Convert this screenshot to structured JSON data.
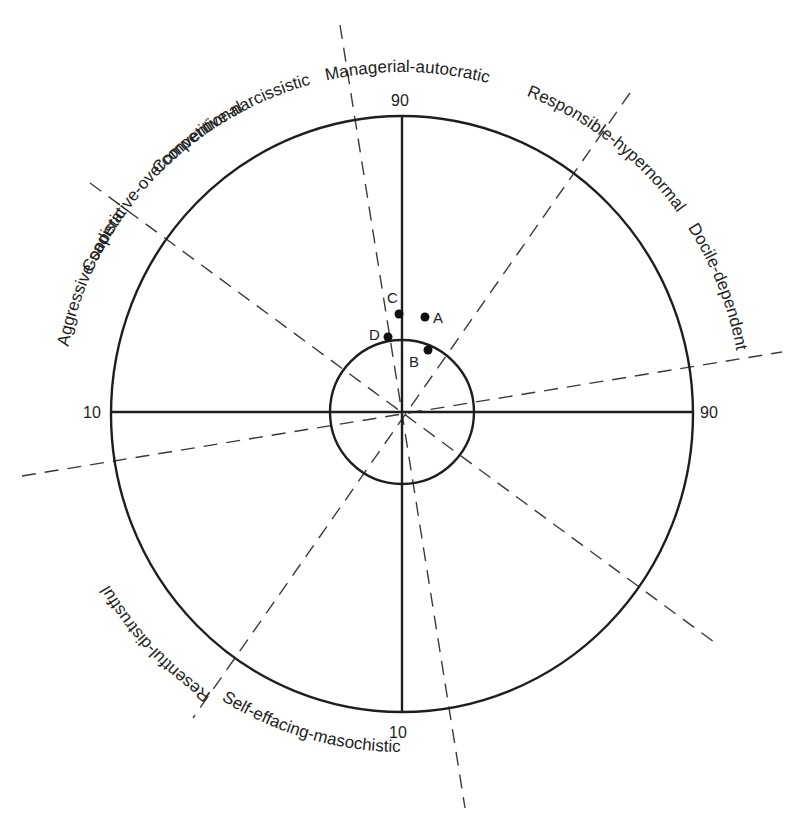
{
  "diagram": {
    "type": "interpersonal-circumplex",
    "center": [
      402,
      412
    ],
    "outer_radius": 294,
    "inner_radius": 72,
    "axis_labels": {
      "top": "90",
      "bottom": "10",
      "left": "10",
      "right": "90"
    },
    "octant_labels": [
      "Managerial-autocratic",
      "Responsible-hypernormal",
      "Cooperative-overconventional",
      "Docile-dependent",
      "Self-effacing-masochistic",
      "Resentful-distrustful",
      "Aggressive-sadistic",
      "Competitive-narcissistic"
    ],
    "points": [
      {
        "label": "A",
        "x": 425,
        "y": 317
      },
      {
        "label": "B",
        "x": 428,
        "y": 350
      },
      {
        "label": "C",
        "x": 399,
        "y": 314
      },
      {
        "label": "D",
        "x": 388,
        "y": 337
      }
    ],
    "colors": {
      "ink": "#1e1e1e",
      "background": "#ffffff"
    }
  }
}
